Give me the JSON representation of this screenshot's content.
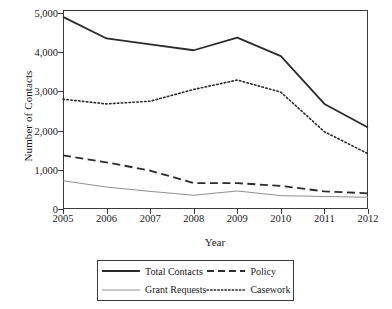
{
  "chart_data": {
    "type": "line",
    "title": "",
    "xlabel": "Year",
    "ylabel": "Number of Contacts",
    "x": [
      2005,
      2006,
      2007,
      2008,
      2009,
      2010,
      2011,
      2012
    ],
    "categories": [
      "2005",
      "2006",
      "2007",
      "2008",
      "2009",
      "2010",
      "2011",
      "2012"
    ],
    "xtick_labels": [
      "2005",
      "2006",
      "2007",
      "2008",
      "2009",
      "2010",
      "2011",
      "2012"
    ],
    "ytick_labels": [
      "0",
      "1,000",
      "2,000",
      "3,000",
      "4,000",
      "5,000"
    ],
    "ytick_values": [
      0,
      1000,
      2000,
      3000,
      4000,
      5000
    ],
    "ylim": [
      0,
      5000
    ],
    "xlim": [
      2005,
      2012
    ],
    "grid": false,
    "legend_position": "below-axes",
    "series": [
      {
        "name": "Total Contacts",
        "style": "solid",
        "color": "#2b2b2b",
        "width": 1.8,
        "values": [
          4900,
          4350,
          4200,
          4050,
          4370,
          3900,
          2680,
          2080
        ]
      },
      {
        "name": "Grant Requests",
        "style": "solid-thin",
        "color": "#8f8f8f",
        "width": 1.0,
        "values": [
          720,
          560,
          450,
          350,
          460,
          340,
          320,
          300
        ]
      },
      {
        "name": "Policy",
        "style": "dashed",
        "color": "#2b2b2b",
        "width": 1.8,
        "values": [
          1370,
          1190,
          980,
          660,
          660,
          590,
          450,
          400
        ]
      },
      {
        "name": "Casework",
        "style": "dotted",
        "color": "#2b2b2b",
        "width": 1.6,
        "values": [
          2800,
          2680,
          2750,
          3050,
          3290,
          2980,
          1970,
          1410
        ]
      }
    ]
  },
  "legend": {
    "entries": [
      {
        "label": "Total Contacts",
        "icon": "solid-line-swatch"
      },
      {
        "label": "Policy",
        "icon": "dashed-line-swatch"
      },
      {
        "label": "Grant Requests",
        "icon": "thin-solid-line-swatch"
      },
      {
        "label": "Casework",
        "icon": "dotted-line-swatch"
      }
    ]
  }
}
